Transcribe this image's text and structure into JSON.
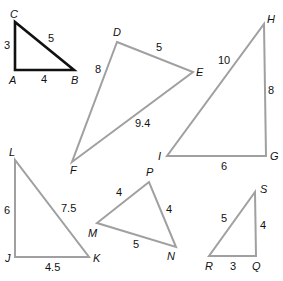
{
  "colors": {
    "background": "#ffffff",
    "highlight": "#111111",
    "normal": "#a0a0a0",
    "text": "#111111"
  },
  "triangles": {
    "abc": {
      "vertices": {
        "A": "A",
        "B": "B",
        "C": "C"
      },
      "sides": {
        "CA": "3",
        "AB": "4",
        "CB": "5"
      }
    },
    "def": {
      "vertices": {
        "D": "D",
        "E": "E",
        "F": "F"
      },
      "sides": {
        "DE": "5",
        "DF": "8",
        "EF": "9.4"
      }
    },
    "ghi": {
      "vertices": {
        "G": "G",
        "H": "H",
        "I": "I"
      },
      "sides": {
        "HI": "10",
        "HG": "8",
        "IG": "6"
      }
    },
    "jkl": {
      "vertices": {
        "J": "J",
        "K": "K",
        "L": "L"
      },
      "sides": {
        "LJ": "6",
        "LK": "7.5",
        "JK": "4.5"
      }
    },
    "mnp": {
      "vertices": {
        "M": "M",
        "N": "N",
        "P": "P"
      },
      "sides": {
        "MP": "4",
        "PN": "4",
        "MN": "5"
      }
    },
    "qrs": {
      "vertices": {
        "Q": "Q",
        "R": "R",
        "S": "S"
      },
      "sides": {
        "RS": "5",
        "SQ": "4",
        "RQ": "3"
      }
    }
  }
}
